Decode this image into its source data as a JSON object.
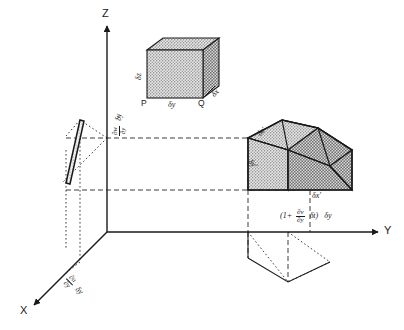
{
  "figure": {
    "axes": {
      "z": "Z",
      "y": "Y",
      "x": "X"
    },
    "undeformed_cube": {
      "vertex_p": "P",
      "vertex_q": "Q",
      "edge_dz": "δz",
      "edge_dy": "δy",
      "edge_dx": "δx"
    },
    "deformed_body": {
      "edge_dz": "δz′",
      "edge_dy": "δy′",
      "edge_dx": "δx′"
    },
    "annotations": {
      "w_shear": {
        "num": "∂w",
        "den": "∂y",
        "tail": "δy"
      },
      "u_shear": {
        "num": "∂u",
        "den": "∂y",
        "tail": "δy"
      },
      "v_stretch": {
        "open": "(1+",
        "num": "∂v",
        "den": "∂y",
        "mid": "δt)",
        "tail": "δy"
      }
    }
  },
  "style": {
    "ink": "#1a1a1a",
    "fill_light": "#d9d9d9",
    "fill_mid": "#c4c4c4",
    "fill_dark": "#b0b0b0"
  }
}
